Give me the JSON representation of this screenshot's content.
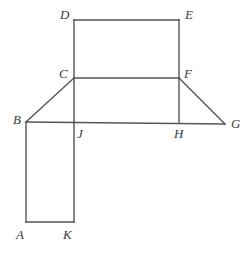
{
  "figure": {
    "background_color": "#ffffff",
    "stroke_color": "#555555",
    "stroke_width": 1.4,
    "label_color": "#3c3c3c",
    "canvas": {
      "width": 250,
      "height": 255
    },
    "points": {
      "A": {
        "x": 26,
        "y": 222
      },
      "B": {
        "x": 26,
        "y": 122
      },
      "C": {
        "x": 74,
        "y": 78
      },
      "D": {
        "x": 74,
        "y": 20
      },
      "E": {
        "x": 179,
        "y": 20
      },
      "F": {
        "x": 179,
        "y": 78
      },
      "G": {
        "x": 225,
        "y": 124
      },
      "H": {
        "x": 179,
        "y": 123
      },
      "J": {
        "x": 74,
        "y": 122
      },
      "K": {
        "x": 74,
        "y": 222
      }
    },
    "segments": [
      {
        "name": "segment-DE",
        "from": "D",
        "to": "E"
      },
      {
        "name": "segment-DC",
        "from": "D",
        "to": "C"
      },
      {
        "name": "segment-EF",
        "from": "E",
        "to": "F"
      },
      {
        "name": "segment-CF",
        "from": "C",
        "to": "F"
      },
      {
        "name": "segment-BC",
        "from": "B",
        "to": "C"
      },
      {
        "name": "segment-FG",
        "from": "F",
        "to": "G"
      },
      {
        "name": "segment-BG",
        "from": "B",
        "to": "G"
      },
      {
        "name": "segment-FH",
        "from": "F",
        "to": "H"
      },
      {
        "name": "segment-CJ",
        "from": "C",
        "to": "J"
      },
      {
        "name": "segment-BA",
        "from": "B",
        "to": "A"
      },
      {
        "name": "segment-JK",
        "from": "J",
        "to": "K"
      },
      {
        "name": "segment-AK",
        "from": "A",
        "to": "K"
      }
    ],
    "labels": [
      {
        "name": "vertex-label-D",
        "text": "D",
        "x": 60,
        "y": 8
      },
      {
        "name": "vertex-label-E",
        "text": "E",
        "x": 185,
        "y": 8
      },
      {
        "name": "vertex-label-C",
        "text": "C",
        "x": 59,
        "y": 67
      },
      {
        "name": "vertex-label-F",
        "text": "F",
        "x": 184,
        "y": 67
      },
      {
        "name": "vertex-label-B",
        "text": "B",
        "x": 13,
        "y": 113
      },
      {
        "name": "vertex-label-G",
        "text": "G",
        "x": 231,
        "y": 117
      },
      {
        "name": "vertex-label-J",
        "text": "J",
        "x": 77,
        "y": 127
      },
      {
        "name": "vertex-label-H",
        "text": "H",
        "x": 174,
        "y": 127
      },
      {
        "name": "vertex-label-A",
        "text": "A",
        "x": 16,
        "y": 228
      },
      {
        "name": "vertex-label-K",
        "text": "K",
        "x": 63,
        "y": 228
      }
    ]
  }
}
